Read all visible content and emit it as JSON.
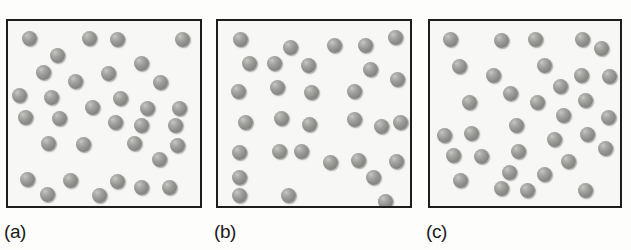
{
  "figure": {
    "name": "three-panel-particle-distribution-diagram",
    "background_color": "#fdfdfc",
    "box_background_color": "#f7f7f5",
    "box_border_color": "#1d1d1d",
    "sphere_color": "#8b8b88",
    "sphere_highlight_color": "#c8c8c6",
    "sphere_shadow_color": "#6f6f6c"
  },
  "panels": [
    {
      "label": "(a)",
      "box": {
        "x": 6,
        "y": 19,
        "width": 196,
        "height": 189
      },
      "label_pos": {
        "x": 4,
        "y": 222
      },
      "sphere_count": 33,
      "sphere_diameter": 15,
      "spheres": [
        {
          "x": 22,
          "y": 31
        },
        {
          "x": 82,
          "y": 31
        },
        {
          "x": 110,
          "y": 32
        },
        {
          "x": 175,
          "y": 32
        },
        {
          "x": 50,
          "y": 48
        },
        {
          "x": 134,
          "y": 56
        },
        {
          "x": 36,
          "y": 65
        },
        {
          "x": 101,
          "y": 66
        },
        {
          "x": 68,
          "y": 74
        },
        {
          "x": 153,
          "y": 75
        },
        {
          "x": 12,
          "y": 88
        },
        {
          "x": 44,
          "y": 90
        },
        {
          "x": 113,
          "y": 91
        },
        {
          "x": 85,
          "y": 100
        },
        {
          "x": 140,
          "y": 101
        },
        {
          "x": 172,
          "y": 101
        },
        {
          "x": 18,
          "y": 110
        },
        {
          "x": 52,
          "y": 111
        },
        {
          "x": 108,
          "y": 115
        },
        {
          "x": 134,
          "y": 118
        },
        {
          "x": 168,
          "y": 118
        },
        {
          "x": 41,
          "y": 136
        },
        {
          "x": 76,
          "y": 137
        },
        {
          "x": 127,
          "y": 136
        },
        {
          "x": 170,
          "y": 138
        },
        {
          "x": 152,
          "y": 152
        },
        {
          "x": 20,
          "y": 172
        },
        {
          "x": 63,
          "y": 173
        },
        {
          "x": 110,
          "y": 174
        },
        {
          "x": 134,
          "y": 180
        },
        {
          "x": 162,
          "y": 180
        },
        {
          "x": 40,
          "y": 187
        },
        {
          "x": 92,
          "y": 188
        }
      ]
    },
    {
      "label": "(b)",
      "box": {
        "x": 216,
        "y": 19,
        "width": 196,
        "height": 189
      },
      "label_pos": {
        "x": 214,
        "y": 222
      },
      "sphere_count": 31,
      "sphere_diameter": 15,
      "spheres": [
        {
          "x": 233,
          "y": 32
        },
        {
          "x": 283,
          "y": 40
        },
        {
          "x": 327,
          "y": 38
        },
        {
          "x": 358,
          "y": 38
        },
        {
          "x": 388,
          "y": 30
        },
        {
          "x": 242,
          "y": 56
        },
        {
          "x": 267,
          "y": 56
        },
        {
          "x": 301,
          "y": 58
        },
        {
          "x": 363,
          "y": 62
        },
        {
          "x": 390,
          "y": 72
        },
        {
          "x": 231,
          "y": 84
        },
        {
          "x": 270,
          "y": 80
        },
        {
          "x": 304,
          "y": 85
        },
        {
          "x": 347,
          "y": 84
        },
        {
          "x": 238,
          "y": 115
        },
        {
          "x": 274,
          "y": 111
        },
        {
          "x": 302,
          "y": 117
        },
        {
          "x": 347,
          "y": 112
        },
        {
          "x": 374,
          "y": 119
        },
        {
          "x": 393,
          "y": 115
        },
        {
          "x": 232,
          "y": 145
        },
        {
          "x": 272,
          "y": 144
        },
        {
          "x": 294,
          "y": 144
        },
        {
          "x": 323,
          "y": 155
        },
        {
          "x": 351,
          "y": 153
        },
        {
          "x": 389,
          "y": 154
        },
        {
          "x": 232,
          "y": 170
        },
        {
          "x": 366,
          "y": 170
        },
        {
          "x": 232,
          "y": 188
        },
        {
          "x": 281,
          "y": 188
        },
        {
          "x": 378,
          "y": 194
        }
      ]
    },
    {
      "label": "(c)",
      "box": {
        "x": 428,
        "y": 19,
        "width": 194,
        "height": 189
      },
      "label_pos": {
        "x": 426,
        "y": 222
      },
      "sphere_count": 33,
      "sphere_diameter": 15,
      "spheres": [
        {
          "x": 443,
          "y": 32
        },
        {
          "x": 494,
          "y": 33
        },
        {
          "x": 528,
          "y": 32
        },
        {
          "x": 575,
          "y": 32
        },
        {
          "x": 594,
          "y": 41
        },
        {
          "x": 452,
          "y": 59
        },
        {
          "x": 486,
          "y": 68
        },
        {
          "x": 537,
          "y": 58
        },
        {
          "x": 574,
          "y": 68
        },
        {
          "x": 602,
          "y": 69
        },
        {
          "x": 553,
          "y": 79
        },
        {
          "x": 503,
          "y": 86
        },
        {
          "x": 462,
          "y": 95
        },
        {
          "x": 530,
          "y": 95
        },
        {
          "x": 578,
          "y": 93
        },
        {
          "x": 556,
          "y": 108
        },
        {
          "x": 601,
          "y": 110
        },
        {
          "x": 509,
          "y": 118
        },
        {
          "x": 437,
          "y": 128
        },
        {
          "x": 464,
          "y": 126
        },
        {
          "x": 511,
          "y": 144
        },
        {
          "x": 547,
          "y": 132
        },
        {
          "x": 580,
          "y": 127
        },
        {
          "x": 598,
          "y": 141
        },
        {
          "x": 446,
          "y": 148
        },
        {
          "x": 474,
          "y": 149
        },
        {
          "x": 561,
          "y": 154
        },
        {
          "x": 502,
          "y": 165
        },
        {
          "x": 537,
          "y": 167
        },
        {
          "x": 453,
          "y": 173
        },
        {
          "x": 494,
          "y": 181
        },
        {
          "x": 578,
          "y": 183
        },
        {
          "x": 520,
          "y": 183
        }
      ]
    }
  ]
}
